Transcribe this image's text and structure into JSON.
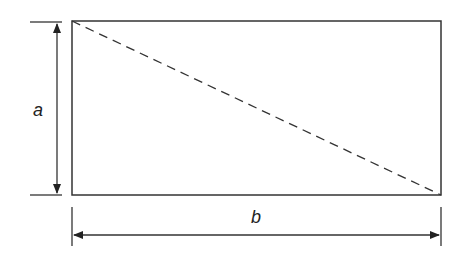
{
  "diagram": {
    "type": "rectangle-dimension",
    "labels": {
      "height": "a",
      "width": "b"
    },
    "diagonal": "dashed",
    "stroke_color": "#333333",
    "background": "#ffffff"
  }
}
